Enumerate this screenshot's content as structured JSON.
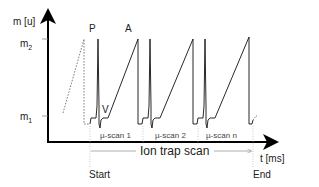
{
  "axes": {
    "y_label": "m [u]",
    "x_label": "t [ms]",
    "y_ticks": [
      {
        "label": "m",
        "sub": "2",
        "name": "m2"
      },
      {
        "label": "m",
        "sub": "1",
        "name": "m1"
      }
    ]
  },
  "annotations": {
    "peak_p": "P",
    "peak_a": "A",
    "valley_v": "V"
  },
  "segments": [
    {
      "label": "µ-scan 1"
    },
    {
      "label": "µ-scan 2"
    },
    {
      "label": "µ-scan n"
    }
  ],
  "scan": {
    "label": "Ion trap scan",
    "start": "Start",
    "end": "End"
  },
  "colors": {
    "line": "#111111",
    "dotted": "#555555",
    "guide": "#999999"
  }
}
